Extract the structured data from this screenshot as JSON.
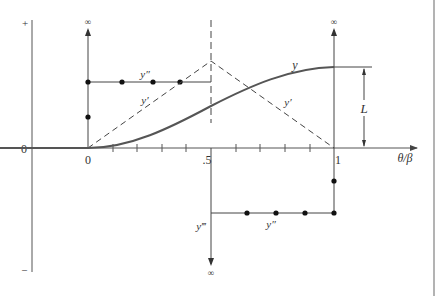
{
  "diagram": {
    "type": "cam-displacement-derivatives",
    "axis": {
      "y_plus_label": "+",
      "y_zero_label": "0",
      "y_minus_label": "–",
      "x_label": "θ/β",
      "tick_labels": [
        "0",
        ".5",
        "1"
      ]
    },
    "curves": {
      "y_label": "y",
      "y_prime_label": "y′",
      "y_prime_right_label": "y′",
      "y_double_prime_top_label": "y″",
      "y_double_prime_bottom_label": "y″",
      "y_triple_prime_label": "y‴"
    },
    "infinity_labels": {
      "top_left": "∞",
      "top_right": "∞",
      "bottom_middle": "∞"
    },
    "dimension_label": "L",
    "colors": {
      "line": "#444444",
      "curve": "#555555",
      "background": "#ffffff",
      "right_border": "#999999"
    }
  }
}
